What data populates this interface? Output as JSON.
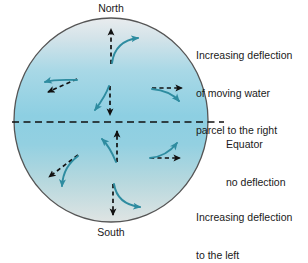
{
  "figure": {
    "background_color": "#ffffff"
  },
  "globe": {
    "name": "earth-disk",
    "border_color": "#555555",
    "gradient": {
      "top_color": "#e9ecee",
      "upper_mid_color": "#a8d8e6",
      "mid_color": "#8dcfe2",
      "lower_mid_color": "#a4d4e2",
      "bottom_color": "#dfe4e3"
    },
    "center_x": 111,
    "center_y": 120,
    "radius_x": 97,
    "radius_y": 102
  },
  "poles": {
    "north_label": "North",
    "south_label": "South"
  },
  "equator": {
    "label_line1": "Equator",
    "label_line2": "no deflection",
    "line_color": "#111111",
    "line_style": "dashed",
    "y": 122
  },
  "annotations": {
    "northern_hemisphere": {
      "line1": "Increasing deflection",
      "line2": "of moving water",
      "line3": "parcel to the right"
    },
    "southern_hemisphere": {
      "line1": "Increasing deflection",
      "line2": "to the left"
    }
  },
  "colors": {
    "dashed_arrow": "#111111",
    "deflected_arrow": "#2e8ca0",
    "text": "#1a1a1a"
  },
  "arrow_pairs": [
    {
      "id": "nh-top",
      "hemisphere": "north",
      "intended_direction": "north",
      "deflection": "right",
      "dashed_arrow": "straight up",
      "curved_arrow": "curves right toward northeast"
    },
    {
      "id": "nh-left",
      "hemisphere": "north",
      "intended_direction": "southwest",
      "deflection": "right",
      "dashed_arrow": "down-left",
      "curved_arrow": "curves right toward west-northwest"
    },
    {
      "id": "nh-center",
      "hemisphere": "north",
      "intended_direction": "south",
      "deflection": "right",
      "dashed_arrow": "straight down",
      "curved_arrow": "curves right toward southwest"
    },
    {
      "id": "nh-right",
      "hemisphere": "north",
      "intended_direction": "east",
      "deflection": "right",
      "dashed_arrow": "straight right",
      "curved_arrow": "curves right toward southeast"
    },
    {
      "id": "sh-center",
      "hemisphere": "south",
      "intended_direction": "north",
      "deflection": "left",
      "dashed_arrow": "straight up",
      "curved_arrow": "curves left toward northwest"
    },
    {
      "id": "sh-right",
      "hemisphere": "south",
      "intended_direction": "east",
      "deflection": "left",
      "dashed_arrow": "straight right",
      "curved_arrow": "curves left toward northeast"
    },
    {
      "id": "sh-left",
      "hemisphere": "south",
      "intended_direction": "northwest",
      "deflection": "left",
      "dashed_arrow": "up-left",
      "curved_arrow": "curves left toward south"
    },
    {
      "id": "sh-bottom",
      "hemisphere": "south",
      "intended_direction": "south",
      "deflection": "left",
      "dashed_arrow": "straight down",
      "curved_arrow": "curves left toward southeast"
    }
  ]
}
